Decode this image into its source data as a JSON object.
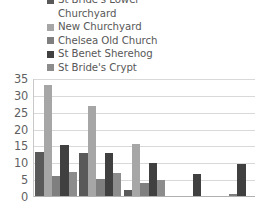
{
  "legend": {
    "items": [
      {
        "label": "St Bride's Lower",
        "color": "#595959",
        "swatch": true,
        "continuation": false
      },
      {
        "label": "Churchyard",
        "color": "#595959",
        "swatch": false,
        "continuation": true
      },
      {
        "label": "New Churchyard",
        "color": "#a6a6a6",
        "swatch": true,
        "continuation": false
      },
      {
        "label": "Chelsea Old Church",
        "color": "#7f7f7f",
        "swatch": true,
        "continuation": false
      },
      {
        "label": "St Benet Sherehog",
        "color": "#404040",
        "swatch": true,
        "continuation": false
      },
      {
        "label": "St Bride's Crypt",
        "color": "#8c8c8c",
        "swatch": true,
        "continuation": false
      }
    ]
  },
  "axis": {
    "yticks": [
      "35",
      "30",
      "25",
      "20",
      "15",
      "10",
      "5",
      "0"
    ]
  },
  "chart_data": {
    "type": "bar",
    "title": "",
    "xlabel": "",
    "ylabel": "",
    "ylim": [
      0,
      35
    ],
    "ytick_step": 5,
    "grid": true,
    "legend_position": "top",
    "categories": [
      "1",
      "2",
      "3",
      "4",
      "5"
    ],
    "series": [
      {
        "name": "St Bride's Lower Churchyard",
        "color": "#595959",
        "values": [
          13.0,
          12.8,
          1.8,
          0,
          0
        ]
      },
      {
        "name": "New Churchyard",
        "color": "#a6a6a6",
        "values": [
          33.0,
          26.7,
          15.5,
          0,
          0
        ]
      },
      {
        "name": "Chelsea Old Church",
        "color": "#7f7f7f",
        "values": [
          6.0,
          5.0,
          3.8,
          0,
          0.7
        ]
      },
      {
        "name": "St Benet Sherehog",
        "color": "#404040",
        "values": [
          15.0,
          12.8,
          9.7,
          6.5,
          9.4
        ]
      },
      {
        "name": "St Bride's Crypt",
        "color": "#8c8c8c",
        "values": [
          7.0,
          6.8,
          4.7,
          0,
          0
        ]
      }
    ]
  }
}
